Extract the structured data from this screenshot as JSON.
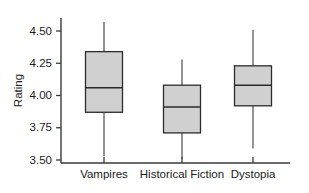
{
  "chart_data": {
    "type": "box",
    "title": "",
    "xlabel": "",
    "ylabel": "Rating",
    "ylim": [
      3.42,
      4.62
    ],
    "grid": false,
    "legend": null,
    "categories": [
      "Vampires",
      "Historical Fiction",
      "Dystopia"
    ],
    "ytick_labels": [
      "3.50",
      "3.75",
      "4.00",
      "4.25",
      "4.50"
    ],
    "ytick_values": [
      3.5,
      3.75,
      4.0,
      4.25,
      4.5
    ],
    "boxes": [
      {
        "name": "Vampires",
        "min": 3.53,
        "q1": 3.87,
        "median": 4.06,
        "q3": 4.34,
        "max": 4.57
      },
      {
        "name": "Historical Fiction",
        "min": 3.51,
        "q1": 3.71,
        "median": 3.91,
        "q3": 4.08,
        "max": 4.28
      },
      {
        "name": "Dystopia",
        "min": 3.59,
        "q1": 3.92,
        "median": 4.08,
        "q3": 4.23,
        "max": 4.51
      }
    ],
    "colors": {
      "box_fill": "#d0d0d0",
      "box_stroke": "#2b2b2b",
      "whisker": "#5a5a5a",
      "axis": "#3a3a3a",
      "text": "#1a1a1a",
      "background": "#ffffff"
    }
  }
}
